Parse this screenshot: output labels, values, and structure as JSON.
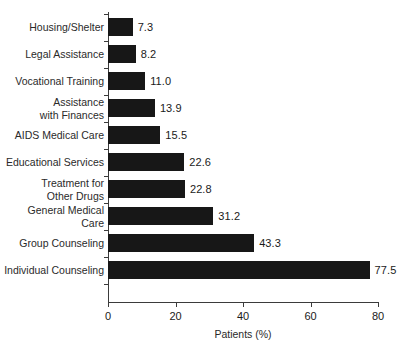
{
  "chart_data": {
    "type": "bar",
    "orientation": "horizontal",
    "title": "",
    "xlabel": "Patients (%)",
    "ylabel": "",
    "xlim": [
      0,
      80
    ],
    "xticks": [
      "0",
      "20",
      "40",
      "60",
      "80"
    ],
    "grid": false,
    "legend": false,
    "bar_color": "#171717",
    "categories": [
      "Housing/Shelter",
      "Legal Assistance",
      "Vocational Training",
      "Assistance\nwith Finances",
      "AIDS Medical Care",
      "Educational Services",
      "Treatment for\nOther Drugs",
      "General Medical Care",
      "Group Counseling",
      "Individual Counseling"
    ],
    "values": [
      7.3,
      8.2,
      11.0,
      13.9,
      15.5,
      22.6,
      22.8,
      31.2,
      43.3,
      77.5
    ],
    "value_labels": [
      "7.3",
      "8.2",
      "11.0",
      "13.9",
      "15.5",
      "22.6",
      "22.8",
      "31.2",
      "43.3",
      "77.5"
    ]
  }
}
